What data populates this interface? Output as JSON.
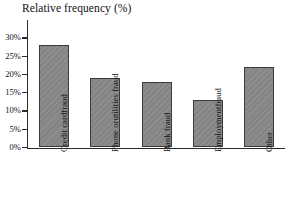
{
  "chart_data": {
    "type": "bar",
    "title": "Relative frequency (%)",
    "xlabel": "",
    "ylabel": "Relative frequency (%)",
    "categories": [
      "Credit card fraud",
      "Phone or utilities fraud",
      "Bank fraud",
      "Employment fraud",
      "Other"
    ],
    "category_lines": [
      [
        "Credit card",
        "fraud"
      ],
      [
        "Phone or",
        "utilities fraud"
      ],
      [
        "Bank fraud"
      ],
      [
        "Employment",
        "fraud"
      ],
      [
        "Other"
      ]
    ],
    "values": [
      28,
      19,
      18,
      13,
      22
    ],
    "ylim": [
      0,
      30
    ],
    "ytick_values": [
      0,
      5,
      10,
      15,
      20,
      25,
      30
    ],
    "ytick_labels": [
      "0%",
      "5%",
      "10%",
      "15%",
      "20%",
      "25%",
      "30%"
    ],
    "grid": false,
    "legend": false,
    "bar_color": "#858585",
    "bar_edge_color": "#3a3a3a",
    "axis_color": "#2b2b2b",
    "background": "#ffffff"
  },
  "axis": {
    "y_title": "Relative frequency (%)"
  }
}
